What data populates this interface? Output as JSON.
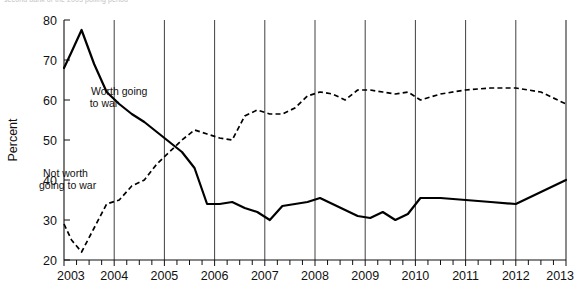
{
  "page": {
    "clipped_header_text": "second bank of the 2003 polling period"
  },
  "chart_data": {
    "type": "line",
    "title": "",
    "xlabel": "",
    "ylabel": "Percent",
    "xlim": [
      2003.0,
      2013.0
    ],
    "ylim": [
      20,
      80
    ],
    "yticks": [
      20,
      30,
      40,
      50,
      60,
      70,
      80
    ],
    "xticks": [
      2003,
      2004,
      2005,
      2006,
      2007,
      2008,
      2009,
      2010,
      2011,
      2012,
      2013
    ],
    "grid": "vertical-year-gridlines",
    "legend": "inline-annotations",
    "minor_tick_interval_years": 0.25,
    "series": [
      {
        "name": "Worth going to war",
        "style": "solid",
        "color": "#000000",
        "label_position": "inline",
        "x": [
          2003.0,
          2003.15,
          2003.35,
          2003.6,
          2003.85,
          2004.1,
          2004.35,
          2004.6,
          2004.85,
          2005.1,
          2005.35,
          2005.6,
          2005.85,
          2006.1,
          2006.35,
          2006.6,
          2006.85,
          2007.1,
          2007.35,
          2007.6,
          2007.85,
          2008.1,
          2008.35,
          2008.6,
          2008.85,
          2009.1,
          2009.35,
          2009.6,
          2009.85,
          2010.1,
          2010.5,
          2011.0,
          2011.5,
          2012.0,
          2012.5,
          2013.0
        ],
        "y": [
          68,
          72,
          77.5,
          69,
          62,
          59,
          56.5,
          54.5,
          52,
          49.5,
          47,
          43,
          34,
          34,
          34.5,
          33,
          32,
          30,
          33.5,
          34,
          34.5,
          35.5,
          34,
          32.5,
          31,
          30.5,
          32,
          30,
          31.5,
          35.5,
          35.5,
          35,
          34.5,
          34,
          37,
          40
        ]
      },
      {
        "name": "Not worth going to war",
        "style": "dashed",
        "color": "#000000",
        "label_position": "inline",
        "x": [
          2003.0,
          2003.15,
          2003.35,
          2003.6,
          2003.85,
          2004.1,
          2004.35,
          2004.6,
          2004.85,
          2005.1,
          2005.35,
          2005.6,
          2005.85,
          2006.1,
          2006.35,
          2006.6,
          2006.85,
          2007.1,
          2007.35,
          2007.6,
          2007.85,
          2008.1,
          2008.35,
          2008.6,
          2008.85,
          2009.1,
          2009.35,
          2009.6,
          2009.85,
          2010.1,
          2010.5,
          2011.0,
          2011.5,
          2012.0,
          2012.5,
          2013.0
        ],
        "y": [
          29,
          25,
          22,
          28,
          34,
          35,
          38.5,
          40,
          44,
          47,
          50,
          52.5,
          51.5,
          50.5,
          50,
          56,
          57.5,
          56.5,
          56.5,
          58,
          61,
          62,
          61.5,
          60,
          62.5,
          62.5,
          62,
          61.5,
          62,
          60,
          61.5,
          62.5,
          63,
          63,
          62,
          59
        ]
      }
    ],
    "annotations": [
      {
        "text": "Worth going",
        "text2": "to war",
        "x_px": 91,
        "y_px": 95
      },
      {
        "text": "Not worth",
        "text2": "going to war",
        "x_px": 40,
        "y_px": 175
      }
    ]
  },
  "axes": {
    "y_title": "Percent",
    "y_labels": [
      "80",
      "70",
      "60",
      "50",
      "40",
      "30",
      "20"
    ],
    "x_labels": [
      "2003",
      "2004",
      "2005",
      "2006",
      "2007",
      "2008",
      "2009",
      "2010",
      "2011",
      "2012",
      "2013"
    ]
  }
}
